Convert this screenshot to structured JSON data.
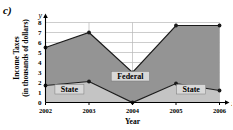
{
  "figure": {
    "part_label": "c)",
    "background": "#ffffff"
  },
  "chart_data": {
    "type": "area",
    "title": "",
    "subtitle": "",
    "stacked": true,
    "xlabel": "Year",
    "ylabel": "Income Taxes (in thousands of dollars)",
    "ylabel_line1": "Income Taxes",
    "ylabel_line2": "(in thousands of dollars)",
    "x_axis_letter": "x",
    "y_axis_letter": "y",
    "categories": [
      "2002",
      "2003",
      "2004",
      "2005",
      "2006"
    ],
    "x": [
      2002,
      2003,
      2004,
      2005,
      2006
    ],
    "xlim": [
      2002,
      2006
    ],
    "ylim": [
      0,
      8
    ],
    "yticks": [
      "0",
      "1",
      "2",
      "3",
      "4",
      "5",
      "6",
      "7",
      "8"
    ],
    "ytick_values": [
      0,
      1,
      2,
      3,
      4,
      5,
      6,
      7,
      8
    ],
    "grid": true,
    "legend_position": "inline-annotations",
    "series": [
      {
        "name": "State",
        "values": [
          1.7,
          2.1,
          0.0,
          1.9,
          1.2
        ],
        "color": "#c4c4c4",
        "annotation": "State",
        "annotations": [
          "State",
          "State"
        ]
      },
      {
        "name": "Federal",
        "values": [
          3.8,
          4.9,
          3.0,
          5.8,
          6.5
        ],
        "cumulative_top": [
          5.5,
          7.0,
          3.0,
          7.7,
          7.7
        ],
        "color": "#949494",
        "annotation": "Federal"
      }
    ],
    "annotations": [
      {
        "text": "State",
        "x": 2002.55,
        "y": 1.15
      },
      {
        "text": "Federal",
        "x": 2003.95,
        "y": 2.45
      },
      {
        "text": "State",
        "x": 2005.35,
        "y": 1.15
      }
    ],
    "colors": {
      "federal_fill": "#949494",
      "state_fill": "#c4c4c4",
      "line": "#1a1a1a",
      "grid": "#b8b8b8",
      "axis": "#000000",
      "label_box": "#d8d8d8"
    }
  }
}
